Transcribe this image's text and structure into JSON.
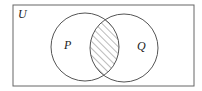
{
  "diagram": {
    "type": "venn",
    "universe_label": "U",
    "sets": [
      {
        "label": "P",
        "cx": 85,
        "cy": 47,
        "r": 34
      },
      {
        "label": "Q",
        "cx": 124,
        "cy": 48,
        "r": 34
      }
    ],
    "shaded_region": "P ∩ Q",
    "colors": {
      "stroke": "#555555",
      "hatch": "#555555",
      "background": "#ffffff"
    }
  }
}
